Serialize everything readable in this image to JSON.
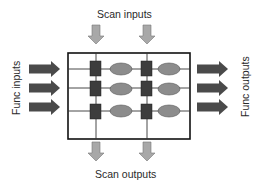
{
  "diagram": {
    "type": "scan-chain-block",
    "labels": {
      "scan_inputs": "Scan inputs",
      "scan_outputs": "Scan outputs",
      "func_inputs": "Func inputs",
      "func_outputs": "Func outputs"
    },
    "colors": {
      "dark_arrow": "#4a4a4a",
      "light_arrow": "#a8a8a8",
      "flop": "#3d3d3d",
      "logic": "#8c8c8c",
      "wire": "#333333",
      "border": "#111111"
    },
    "grid": {
      "rows": 3,
      "columns": 2,
      "cells_per_row": [
        "flip-flop",
        "logic",
        "flip-flop",
        "logic"
      ]
    },
    "arrows": {
      "func_in_count": 3,
      "func_out_count": 3,
      "scan_in_count": 2,
      "scan_out_count": 2
    }
  }
}
